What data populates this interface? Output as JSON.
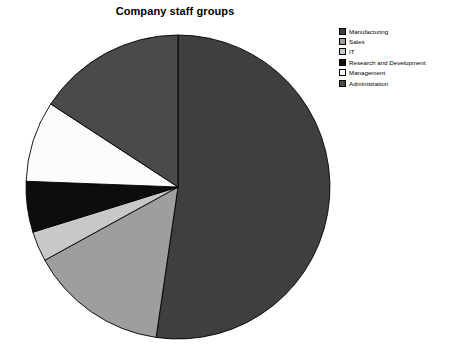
{
  "chart_data": {
    "type": "pie",
    "title": "Company staff groups",
    "xlabel": "",
    "ylabel": "",
    "legend_position": "right",
    "grid": false,
    "start_angle_deg": 90,
    "direction": "clockwise",
    "categories": [
      "Manufacturing",
      "Sales",
      "IT",
      "Research and Development",
      "Management",
      "Administration"
    ],
    "values": [
      52.3,
      14.7,
      3.2,
      5.4,
      8.6,
      15.8
    ],
    "slice_angles_deg": [
      188.3,
      52.9,
      11.5,
      19.4,
      31.0,
      56.9
    ],
    "colors": [
      "#3f3f3f",
      "#9e9e9e",
      "#c8c8c8",
      "#0d0d0d",
      "#fbfbfb",
      "#4a4a4a"
    ],
    "slices": [
      {
        "label": "Manufacturing",
        "value": 52.3,
        "color": "#3f3f3f"
      },
      {
        "label": "Sales",
        "value": 14.7,
        "color": "#9e9e9e"
      },
      {
        "label": "IT",
        "value": 3.2,
        "color": "#c8c8c8"
      },
      {
        "label": "Research and Development",
        "value": 5.4,
        "color": "#0d0d0d"
      },
      {
        "label": "Management",
        "value": 8.6,
        "color": "#fbfbfb"
      },
      {
        "label": "Administration",
        "value": 15.8,
        "color": "#4a4a4a"
      }
    ],
    "edge_color": "#000000"
  },
  "legend": {
    "items": [
      {
        "label": "Manufacturing",
        "color": "#3f3f3f"
      },
      {
        "label": "Sales",
        "color": "#9e9e9e"
      },
      {
        "label": "IT",
        "color": "#c8c8c8"
      },
      {
        "label": "Research and Development",
        "color": "#0d0d0d"
      },
      {
        "label": "Management",
        "color": "#fbfbfb"
      },
      {
        "label": "Administration",
        "color": "#4a4a4a"
      }
    ]
  },
  "geometry": {
    "center_x": 178,
    "center_y": 187,
    "radius": 152
  }
}
